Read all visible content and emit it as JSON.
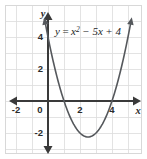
{
  "figure": {
    "name": "quadratic-function-graph",
    "equation_label": {
      "lead": "y",
      "equals": "=",
      "term1_base": "x",
      "term1_exp": "2",
      "term2": "− 5x",
      "term3": "+ 4",
      "full_text": "y = x² − 5x + 4"
    },
    "axes": {
      "x_axis_label": "x",
      "y_axis_label": "y",
      "x_ticks": [
        "-2",
        "0",
        "2",
        "4"
      ],
      "y_ticks": [
        "4",
        "2",
        "0",
        "-2"
      ]
    },
    "colors": {
      "curve": "#55585c",
      "axis": "#3a3a3a",
      "grid": "#dcdcdc",
      "frame": "#d8d8d8",
      "text": "#1d1d1d",
      "background": "#ffffff"
    }
  },
  "chart_data": {
    "type": "line",
    "title": "",
    "subtitle": "",
    "xlabel": "x",
    "ylabel": "y",
    "annotations": [
      "y = x² − 5x + 4"
    ],
    "legend": [],
    "legend_position": "none",
    "grid": true,
    "grid_spacing": 1,
    "xlim": [
      -2.7,
      5.8
    ],
    "ylim": [
      -3.3,
      5.9
    ],
    "xticks": [
      -2,
      0,
      2,
      4
    ],
    "yticks": [
      4,
      2,
      0,
      -2
    ],
    "xtick_labels": [
      "-2",
      "0",
      "2",
      "4"
    ],
    "ytick_labels": [
      "4",
      "2",
      "0",
      "-2"
    ],
    "series": [
      {
        "name": "y = x² − 5x + 4",
        "function": "y = x^2 - 5x + 4",
        "color": "#55585c",
        "roots": [
          1,
          4
        ],
        "vertex": [
          2.5,
          -2.25
        ],
        "y_intercept": 4,
        "x": [
          -0.6,
          -0.4,
          -0.2,
          0,
          0.2,
          0.4,
          0.6,
          0.8,
          1,
          1.2,
          1.4,
          1.6,
          1.8,
          2,
          2.2,
          2.4,
          2.5,
          2.6,
          2.8,
          3,
          3.2,
          3.4,
          3.6,
          3.8,
          4,
          4.2,
          4.4,
          4.6,
          4.8,
          5,
          5.2,
          5.4
        ],
        "y": [
          7.36,
          6.16,
          5.04,
          4,
          3.04,
          2.16,
          1.36,
          0.64,
          0,
          -0.56,
          -1.04,
          -1.44,
          -1.76,
          -2,
          -2.16,
          -2.24,
          -2.25,
          -2.24,
          -2.16,
          -2,
          -1.76,
          -1.44,
          -1.04,
          -0.56,
          0,
          0.64,
          1.36,
          2.16,
          3.04,
          4,
          5.04,
          6.16
        ]
      }
    ]
  }
}
